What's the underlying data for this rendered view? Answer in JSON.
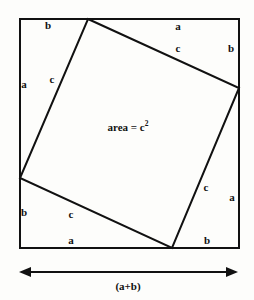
{
  "figure": {
    "background_color": "#fdfdfb",
    "stroke_color": "#111111",
    "outer_square": {
      "x": 19,
      "y": 18,
      "width": 221,
      "height": 231,
      "stroke_width": 2
    },
    "inner_square": {
      "stroke_width": 2,
      "vertices": [
        {
          "name": "top",
          "x": 88,
          "y": 19
        },
        {
          "name": "right",
          "x": 239,
          "y": 88
        },
        {
          "name": "bottom",
          "x": 172,
          "y": 248
        },
        {
          "name": "left",
          "x": 20,
          "y": 178
        }
      ]
    },
    "area_label": {
      "prefix": "area = c",
      "exponent": "2",
      "x": 128,
      "y": 127
    },
    "dimension_arrow": {
      "x1": 19,
      "x2": 238,
      "y": 272,
      "label": "(a+b)",
      "label_x": 128,
      "label_y": 286
    },
    "segment_labels": [
      {
        "id": "top-left-b",
        "text": "b",
        "x": 48,
        "y": 25
      },
      {
        "id": "top-right-a",
        "text": "a",
        "x": 178,
        "y": 26
      },
      {
        "id": "upper-right-c",
        "text": "c",
        "x": 178,
        "y": 48
      },
      {
        "id": "right-top-b",
        "text": "b",
        "x": 231,
        "y": 48
      },
      {
        "id": "left-top-a",
        "text": "a",
        "x": 24,
        "y": 84
      },
      {
        "id": "upper-left-c",
        "text": "c",
        "x": 52,
        "y": 79
      },
      {
        "id": "right-lower-c",
        "text": "c",
        "x": 206,
        "y": 187
      },
      {
        "id": "right-bottom-a",
        "text": "a",
        "x": 232,
        "y": 197
      },
      {
        "id": "left-bottom-b",
        "text": "b",
        "x": 24,
        "y": 212
      },
      {
        "id": "lower-left-c",
        "text": "c",
        "x": 71,
        "y": 214
      },
      {
        "id": "bottom-left-a",
        "text": "a",
        "x": 71,
        "y": 240
      },
      {
        "id": "bottom-right-b",
        "text": "b",
        "x": 207,
        "y": 240
      }
    ]
  }
}
